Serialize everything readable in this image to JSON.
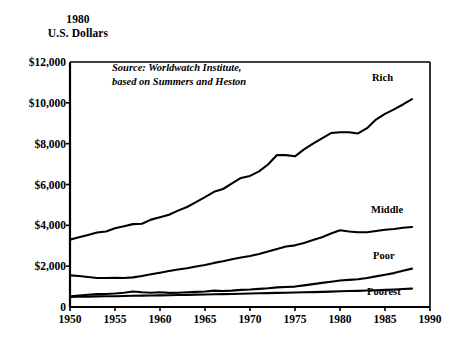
{
  "header": {
    "line1": "1980",
    "line2": "U.S. Dollars"
  },
  "source_note": {
    "line1": "Source: Worldwatch Institute,",
    "line2": "based on Summers and Heston"
  },
  "labels": {
    "rich": "Rich",
    "middle": "Middle",
    "poor": "Poor",
    "poorest": "Poorest"
  },
  "axis": {
    "y_ticks": [
      "$12,000",
      "$10,000",
      "$8,000",
      "$6,000",
      "$4,000",
      "$2,000",
      "0"
    ],
    "x_ticks": [
      "1950",
      "1955",
      "1960",
      "1965",
      "1970",
      "1975",
      "1980",
      "1985",
      "1990"
    ]
  },
  "colors": {
    "line": "#000000",
    "background": "#ffffff",
    "text": "#000000"
  },
  "chart_data": {
    "type": "line",
    "title": "",
    "subtitle": "",
    "xlabel": "",
    "ylabel": "1980 U.S. Dollars",
    "xlim": [
      1950,
      1990
    ],
    "ylim": [
      0,
      12000
    ],
    "grid": false,
    "legend": "inline-right-of-series",
    "annotations": [
      "Source: Worldwatch Institute,",
      "based on Summers and Heston"
    ],
    "x": [
      1950,
      1951,
      1952,
      1953,
      1954,
      1955,
      1956,
      1957,
      1958,
      1959,
      1960,
      1961,
      1962,
      1963,
      1964,
      1965,
      1966,
      1967,
      1968,
      1969,
      1970,
      1971,
      1972,
      1973,
      1974,
      1975,
      1976,
      1977,
      1978,
      1979,
      1980,
      1981,
      1982,
      1983,
      1984,
      1985,
      1986,
      1987,
      1988
    ],
    "series": [
      {
        "name": "Rich",
        "values": [
          3300,
          3420,
          3530,
          3650,
          3700,
          3860,
          3960,
          4060,
          4080,
          4280,
          4400,
          4520,
          4720,
          4900,
          5140,
          5380,
          5640,
          5780,
          6060,
          6320,
          6420,
          6640,
          6980,
          7440,
          7440,
          7380,
          7720,
          8000,
          8260,
          8520,
          8560,
          8560,
          8500,
          8760,
          9180,
          9460,
          9680,
          9920,
          10180
        ]
      },
      {
        "name": "Middle",
        "values": [
          1550,
          1520,
          1470,
          1420,
          1420,
          1430,
          1420,
          1450,
          1520,
          1600,
          1680,
          1760,
          1840,
          1900,
          1980,
          2060,
          2160,
          2240,
          2340,
          2420,
          2500,
          2600,
          2720,
          2840,
          2960,
          3020,
          3140,
          3280,
          3420,
          3600,
          3760,
          3700,
          3660,
          3660,
          3720,
          3780,
          3820,
          3880,
          3920
        ]
      },
      {
        "name": "Poor",
        "values": [
          520,
          560,
          600,
          630,
          640,
          660,
          700,
          760,
          720,
          700,
          720,
          690,
          700,
          720,
          740,
          760,
          800,
          780,
          800,
          840,
          860,
          890,
          920,
          960,
          980,
          1000,
          1060,
          1120,
          1180,
          1240,
          1300,
          1330,
          1360,
          1420,
          1500,
          1580,
          1660,
          1780,
          1880
        ]
      },
      {
        "name": "Poorest",
        "values": [
          490,
          500,
          510,
          520,
          525,
          530,
          540,
          550,
          555,
          560,
          570,
          575,
          585,
          595,
          605,
          615,
          625,
          630,
          640,
          650,
          660,
          670,
          680,
          690,
          700,
          710,
          720,
          730,
          740,
          755,
          770,
          780,
          790,
          805,
          820,
          840,
          860,
          880,
          900
        ]
      }
    ]
  }
}
